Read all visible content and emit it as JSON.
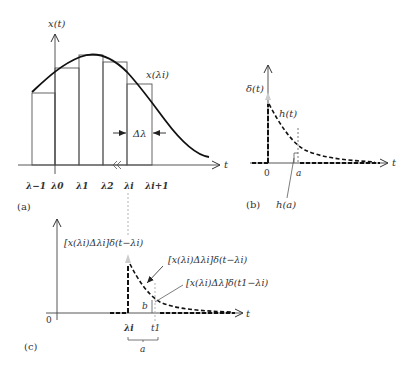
{
  "figure": {
    "panel_a": {
      "caption": "(a)",
      "y_axis_label": "x(t)",
      "x_axis_label": "t",
      "curve_label": "x(λi)",
      "width_label": "Δλ",
      "tick_labels": [
        "λ−1",
        "λ0",
        "λ1",
        "λ2",
        "λi",
        "λi+1"
      ]
    },
    "panel_b": {
      "caption": "(b)",
      "impulse_label": "δ(t)",
      "response_label": "h(t)",
      "x_axis_label": "t",
      "origin_label": "0",
      "a_label": "a",
      "value_label": "h(a)"
    },
    "panel_c": {
      "caption": "(c)",
      "impulse_label": "[x(λi)Δλi]δ(t−λi)",
      "response_label": "[x(λi)Δλi]δ(t−λi)",
      "value_label": "[x(λi)Δλ]δ(t1−λi)",
      "b_label": "b",
      "x_axis_label": "t",
      "origin_label": "0",
      "tick_lambda": "λi",
      "tick_t1": "t1",
      "span_label": "a"
    }
  }
}
